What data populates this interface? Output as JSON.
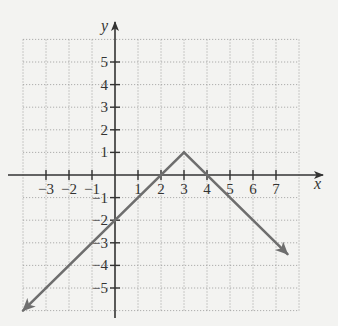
{
  "chart_data": {
    "type": "line",
    "title": "",
    "xlabel": "x",
    "ylabel": "y",
    "xlim": [
      -4,
      8
    ],
    "ylim": [
      -6,
      6
    ],
    "grid": true,
    "x_tick_labels": [
      "−3",
      "−2",
      "−1",
      "1",
      "2",
      "3",
      "4",
      "5",
      "6",
      "7"
    ],
    "x_ticks": [
      -3,
      -2,
      -1,
      1,
      2,
      3,
      4,
      5,
      6,
      7
    ],
    "y_tick_labels": [
      "5",
      "4",
      "3",
      "2",
      "1",
      "−1",
      "−2",
      "−3",
      "−4",
      "−5"
    ],
    "y_ticks": [
      5,
      4,
      3,
      2,
      1,
      -1,
      -2,
      -3,
      -4,
      -5
    ],
    "series": [
      {
        "name": "y = −|x − 3| + 1",
        "points": [
          [
            -4,
            -6
          ],
          [
            -2,
            -4
          ],
          [
            0,
            -2
          ],
          [
            2,
            0
          ],
          [
            3,
            1
          ],
          [
            4,
            0
          ],
          [
            5,
            -1
          ],
          [
            7,
            -3
          ],
          [
            7.5,
            -3.5
          ]
        ],
        "vertex": [
          3,
          1
        ],
        "arrow_ends": [
          [
            -4,
            -6
          ],
          [
            7.5,
            -3.5
          ]
        ],
        "color": "#6e6e6e"
      }
    ],
    "legend": null
  },
  "style": {
    "background": "#f3f3f1",
    "axis_color": "#333333",
    "grid_color": "#9a9a9a",
    "line_color": "#6e6e6e"
  },
  "layout": {
    "origin_px": [
      115,
      175
    ],
    "unit_px_x": 23,
    "unit_px_y": 22.6
  }
}
